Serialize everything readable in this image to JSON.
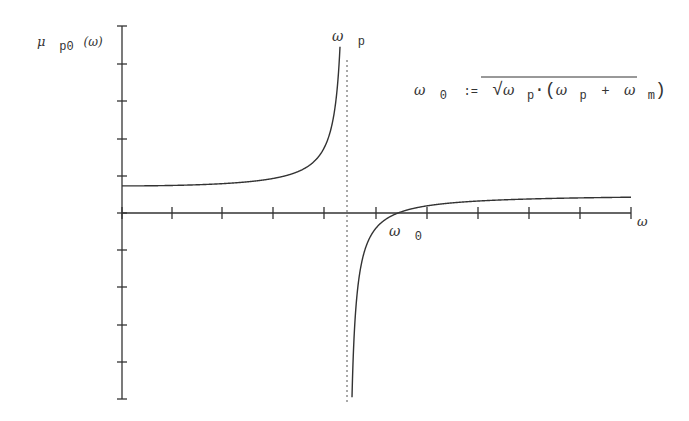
{
  "chart_data": {
    "type": "line",
    "title": "",
    "ylabel": "μ p0 (ω)",
    "xlabel": "ω",
    "annotations": {
      "pole_label": "ω p",
      "zero_label": "ω 0",
      "formula": "ω 0 := √(ω p·(ω p + ω m))"
    },
    "axes": {
      "origin_px": [
        122,
        213
      ],
      "x_end_px": 631,
      "y_top_px": 26,
      "y_bottom_px": 399,
      "x_ticks_px": [
        122,
        172,
        222,
        273,
        324,
        376,
        427,
        478,
        529,
        580,
        631
      ],
      "y_ticks_px": [
        26,
        64,
        101,
        139,
        176,
        213,
        250,
        287,
        325,
        362,
        399
      ]
    },
    "grid": false,
    "model": {
      "description": "mu(w) = A*(w0^2 - w^2)/(wp^2 - w^2), units in axis pixels",
      "A": 18,
      "wp": 225,
      "w0": 276
    },
    "series": [
      {
        "name": "mu_p0 (lower branch, w < wp)",
        "x": [
          0,
          50,
          100,
          150,
          200,
          219
        ],
        "y": [
          27,
          28.5,
          34,
          52,
          152,
          420
        ]
      },
      {
        "name": "mu_p0 (upper branch, w > wp)",
        "x": [
          230,
          250,
          276,
          300,
          400,
          509
        ],
        "y": [
          -185,
          -46,
          0,
          4.6,
          12.5,
          15.8
        ]
      }
    ],
    "asymptote": {
      "type": "vertical",
      "style": "dotted",
      "x_px": 347
    }
  },
  "labels": {
    "y_mu": "μ",
    "y_sub": "p0",
    "y_arg": "(ω)",
    "x_axis": "ω",
    "pole_omega": "ω",
    "pole_sub": "p",
    "zero_omega": "ω",
    "zero_sub": "0",
    "f_lhs": "ω",
    "f_lhs_sub": "0",
    "f_assign": ":=",
    "f_w1": "ω",
    "f_p1": "p",
    "f_dot": "·(",
    "f_w2": "ω",
    "f_p2": "p",
    "f_plus": "+",
    "f_w3": "ω",
    "f_m": "m",
    "f_close": ")"
  }
}
